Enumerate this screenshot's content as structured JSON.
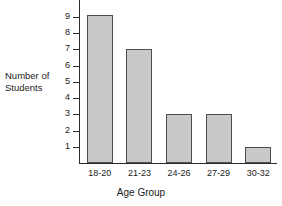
{
  "chart_data": {
    "type": "bar",
    "title": "",
    "categories": [
      "18-20",
      "21-23",
      "24-26",
      "27-29",
      "30-32"
    ],
    "values": [
      9.1,
      7,
      3,
      3,
      1
    ],
    "xlabel": "Age Group",
    "ylabel": "Number of\nStudents",
    "ylim": [
      0,
      9.6
    ],
    "yticks": [
      1,
      2,
      3,
      4,
      5,
      6,
      7,
      8,
      9
    ],
    "ytick_labels": [
      "1",
      "2",
      "3",
      "4",
      "5",
      "6",
      "7",
      "8",
      "9"
    ],
    "grid": false,
    "legend": null,
    "bar_fill_color": "#c9c9c9",
    "bar_border_color": "#4d4d4d",
    "axis_color": "#2b2b2b",
    "text_color": "#1a1a1a"
  }
}
